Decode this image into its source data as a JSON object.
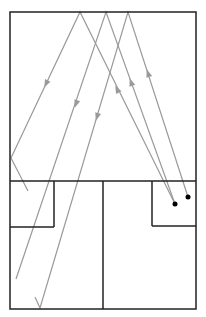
{
  "diagram": {
    "type": "ray-reflection-floorplan",
    "colors": {
      "wall": "#222222",
      "ray": "#9a9a9a",
      "source": "#000000",
      "background": "#ffffff"
    },
    "room": {
      "x1": 10,
      "y1": 12,
      "x2": 196,
      "y2": 309
    },
    "walls": [
      {
        "id": "divider-horizontal",
        "x1": 10,
        "y1": 181,
        "x2": 196,
        "y2": 181
      },
      {
        "id": "divider-vertical",
        "x1": 103,
        "y1": 181,
        "x2": 103,
        "y2": 309
      },
      {
        "id": "left-box-right",
        "x1": 54,
        "y1": 181,
        "x2": 54,
        "y2": 227
      },
      {
        "id": "left-box-bottom",
        "x1": 10,
        "y1": 227,
        "x2": 54,
        "y2": 227
      },
      {
        "id": "right-box-left",
        "x1": 152,
        "y1": 181,
        "x2": 152,
        "y2": 226
      },
      {
        "id": "right-box-bottom",
        "x1": 152,
        "y1": 226,
        "x2": 196,
        "y2": 226
      }
    ],
    "sources": [
      {
        "id": "source-1",
        "x": 175,
        "y": 204
      },
      {
        "id": "source-2",
        "x": 188,
        "y": 197
      }
    ],
    "rays": [
      {
        "id": "ray-1",
        "points": [
          [
            175,
            204
          ],
          [
            80,
            12
          ],
          [
            11,
            158
          ],
          [
            28,
            191
          ]
        ]
      },
      {
        "id": "ray-2",
        "points": [
          [
            175,
            204
          ],
          [
            106,
            12
          ],
          [
            16,
            279
          ]
        ]
      },
      {
        "id": "ray-3",
        "points": [
          [
            188,
            197
          ],
          [
            128,
            12
          ],
          [
            40,
            308
          ],
          [
            35,
            297
          ]
        ]
      }
    ],
    "arrows": [
      {
        "id": "arrow-up-1",
        "x": 117,
        "y": 89,
        "dir": "up"
      },
      {
        "id": "arrow-up-2",
        "x": 131,
        "y": 82,
        "dir": "up"
      },
      {
        "id": "arrow-up-3",
        "x": 148,
        "y": 73,
        "dir": "up"
      },
      {
        "id": "arrow-down-1",
        "x": 46,
        "y": 84,
        "dir": "down"
      },
      {
        "id": "arrow-down-2",
        "x": 76,
        "y": 104,
        "dir": "down"
      },
      {
        "id": "arrow-down-3",
        "x": 97,
        "y": 117,
        "dir": "down"
      }
    ]
  }
}
